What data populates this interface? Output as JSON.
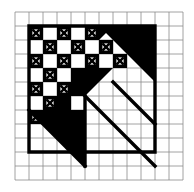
{
  "figure": {
    "colors": {
      "background": "#ffffff",
      "ink": "#000000",
      "light_grid": "#8c8c8c"
    },
    "canvas": {
      "width": 194,
      "height": 192
    },
    "lattice": {
      "origin_x": 15,
      "origin_y": 12,
      "cell": 14,
      "cols": 12,
      "rows": 12,
      "line_width": 0.8,
      "label": "light-background-grid"
    },
    "bold": {
      "line_width": 3.4,
      "frame": {
        "col0": 1,
        "row0": 1,
        "col1": 10,
        "row1": 10,
        "label": "bold-boundary-polygon"
      }
    },
    "cross_cells": [
      {
        "col": 1,
        "row": 1
      },
      {
        "col": 3,
        "row": 1
      },
      {
        "col": 5,
        "row": 1
      },
      {
        "col": 2,
        "row": 2
      },
      {
        "col": 4,
        "row": 2
      },
      {
        "col": 6,
        "row": 2
      },
      {
        "col": 1,
        "row": 3
      },
      {
        "col": 3,
        "row": 3
      },
      {
        "col": 5,
        "row": 3
      },
      {
        "col": 7,
        "row": 3
      },
      {
        "col": 2,
        "row": 4
      },
      {
        "col": 1,
        "row": 5
      },
      {
        "col": 3,
        "row": 5
      },
      {
        "col": 2,
        "row": 6
      },
      {
        "col": 1,
        "row": 7
      },
      {
        "col": 3,
        "row": 7
      }
    ],
    "solid_cells": [
      {
        "col": 4,
        "row": 4
      },
      {
        "col": 3,
        "row": 6
      },
      {
        "col": 4,
        "row": 5
      }
    ],
    "triangles": [
      {
        "name": "upper-right-large-triangle",
        "points": "6,1 10,1 10,5"
      },
      {
        "name": "center-wedge-triangle",
        "points": "5,4 7,4 5,6"
      },
      {
        "name": "small-corner-triangle-upper",
        "points": "6,1 7,1 6,2"
      },
      {
        "name": "lower-left-diagonal-triangle",
        "points": "1,7 5,7 5,11"
      }
    ],
    "diagonals": [
      {
        "name": "inner-diagonal-line",
        "from_col": 5,
        "from_row": 6,
        "to_col": 10,
        "to_row": 11
      },
      {
        "name": "outer-diagonal-line",
        "from_col": 7,
        "from_row": 5,
        "to_col": 10,
        "to_row": 8
      },
      {
        "name": "lower-left-edge-line",
        "from_col": 1,
        "from_row": 7,
        "to_col": 5,
        "to_row": 11
      }
    ],
    "verticals": [
      {
        "name": "mid-vertical-stem",
        "col": 5,
        "row0": 6,
        "row1": 11
      }
    ]
  }
}
